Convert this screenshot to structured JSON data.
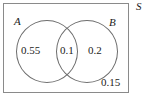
{
  "figure": {
    "type": "venn-diagram",
    "sample_space_label": "S",
    "sets": [
      {
        "id": "A",
        "label": "A"
      },
      {
        "id": "B",
        "label": "B"
      }
    ],
    "regions": [
      {
        "id": "a-only",
        "label": "A only",
        "value": "0.55"
      },
      {
        "id": "intersection",
        "label": "A and B",
        "value": "0.1"
      },
      {
        "id": "b-only",
        "label": "B only",
        "value": "0.2"
      },
      {
        "id": "outside",
        "label": "Neither A nor B",
        "value": "0.15"
      }
    ],
    "colors": {
      "background": "#ffffff",
      "rect_border": "#8a8a8a",
      "circle_border": "#6d6d6d",
      "text": "#1b1b1b"
    }
  }
}
